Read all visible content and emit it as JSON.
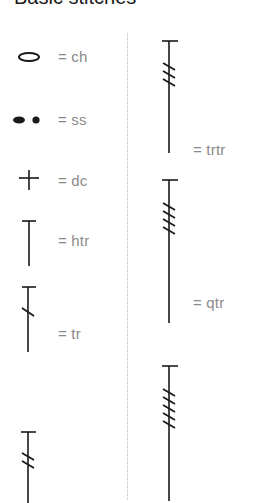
{
  "title": "Basic stitches",
  "left_column": [
    {
      "symbol": "chain-oval",
      "label": "= ch",
      "abbr": "ch"
    },
    {
      "symbol": "slip-stitch-dots",
      "label": "= ss",
      "abbr": "ss"
    },
    {
      "symbol": "plus",
      "label": "= dc",
      "abbr": "dc"
    },
    {
      "symbol": "T-no-slash",
      "label": "= htr",
      "abbr": "htr"
    },
    {
      "symbol": "T-1-slash",
      "label": "= tr",
      "abbr": "tr"
    },
    {
      "symbol": "T-2-slash",
      "label": "",
      "abbr": ""
    }
  ],
  "right_column": [
    {
      "symbol": "T-3-slash",
      "label": "= trtr",
      "abbr": "trtr"
    },
    {
      "symbol": "T-4-slash",
      "label": "= qtr",
      "abbr": "qtr"
    },
    {
      "symbol": "T-5-slash",
      "label": "",
      "abbr": ""
    }
  ],
  "colors": {
    "symbol": "#1a1a1a",
    "label": "#8a8a8a",
    "divider": "#bdbdbd",
    "background": "#ffffff"
  }
}
